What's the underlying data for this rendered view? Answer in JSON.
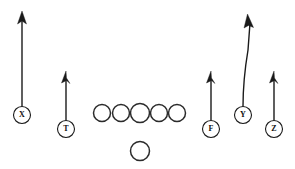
{
  "diagram": {
    "width": 295,
    "height": 169,
    "background_color": "#ffffff",
    "ink_color": "#1a1a1a"
  },
  "players": [
    {
      "id": "x",
      "label": "X",
      "role": "wide-receiver-left",
      "cx": 22,
      "cy": 115,
      "r": 8.5,
      "labeled": true
    },
    {
      "id": "t",
      "label": "T",
      "role": "slot-left",
      "cx": 66,
      "cy": 129,
      "r": 8.5,
      "labeled": true
    },
    {
      "id": "f",
      "label": "F",
      "role": "slot-right",
      "cx": 211,
      "cy": 129,
      "r": 8.5,
      "labeled": true
    },
    {
      "id": "y",
      "label": "Y",
      "role": "tight-end",
      "cx": 243,
      "cy": 115,
      "r": 8.5,
      "labeled": true
    },
    {
      "id": "z",
      "label": "Z",
      "role": "wide-receiver-right",
      "cx": 274,
      "cy": 129,
      "r": 8.5,
      "labeled": true
    }
  ],
  "linemen": [
    {
      "id": "ol-1",
      "cx": 102,
      "cy": 113,
      "r": 8.5
    },
    {
      "id": "ol-2",
      "cx": 121,
      "cy": 113,
      "r": 8.5
    },
    {
      "id": "ol-3",
      "cx": 140,
      "cy": 113,
      "r": 9.5
    },
    {
      "id": "ol-4",
      "cx": 159,
      "cy": 113,
      "r": 8.5
    },
    {
      "id": "ol-5",
      "cx": 177,
      "cy": 113,
      "r": 8.5
    }
  ],
  "backfield": [
    {
      "id": "qb",
      "cx": 140,
      "cy": 151,
      "r": 9.5
    }
  ],
  "routes": [
    {
      "id": "route-x",
      "player": "X",
      "path": "M 22 106.5 L 22 19",
      "arrow": {
        "type": "standard",
        "points": "22,11 17.5,24 22,21 26.5,24"
      }
    },
    {
      "id": "route-t",
      "player": "T",
      "path": "M 66 120.5 L 66 79",
      "arrow": {
        "type": "flag",
        "points": "66,71 61.5,83 66.5,80.5 70,83.5 66.5,78"
      }
    },
    {
      "id": "route-f",
      "player": "F",
      "path": "M 211 120.5 L 211 79",
      "arrow": {
        "type": "flag",
        "points": "211,71 206.5,83 211.5,80.5 215,83.5 211.5,78"
      }
    },
    {
      "id": "route-y",
      "player": "Y",
      "path": "M 243 106.5 C 243 92 244 74 248 50 L 250 23",
      "arrow": {
        "type": "standard",
        "points": "247.5,14 244,28 248.5,25.5 253.5,27.5"
      }
    },
    {
      "id": "route-z",
      "player": "Z",
      "path": "M 274 120.5 L 274 79",
      "arrow": {
        "type": "flag",
        "points": "274,71 269.5,83 274.5,80.5 278,83.5 274.5,78"
      }
    }
  ]
}
